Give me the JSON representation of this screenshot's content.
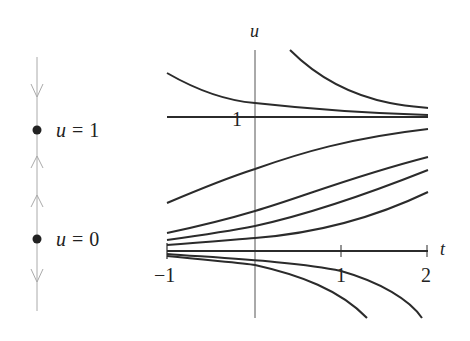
{
  "phase_line": {
    "equilibria": [
      {
        "label_var": "u",
        "label_eq": "=",
        "label_val": "1",
        "type": "stable"
      },
      {
        "label_var": "u",
        "label_eq": "=",
        "label_val": "0",
        "type": "unstable"
      }
    ],
    "arrows": [
      "down",
      "up",
      "up",
      "down"
    ]
  },
  "plot": {
    "y_axis_label": "u",
    "x_axis_label": "t",
    "x_ticks": [
      "−1",
      "1",
      "2"
    ],
    "y_tick_label": "1",
    "equation_hint": "du/dt = u(1 - u)",
    "colors": {
      "curve": "#2b2b2b",
      "axis": "#555555",
      "phase_line": "#aaaaaa"
    }
  }
}
